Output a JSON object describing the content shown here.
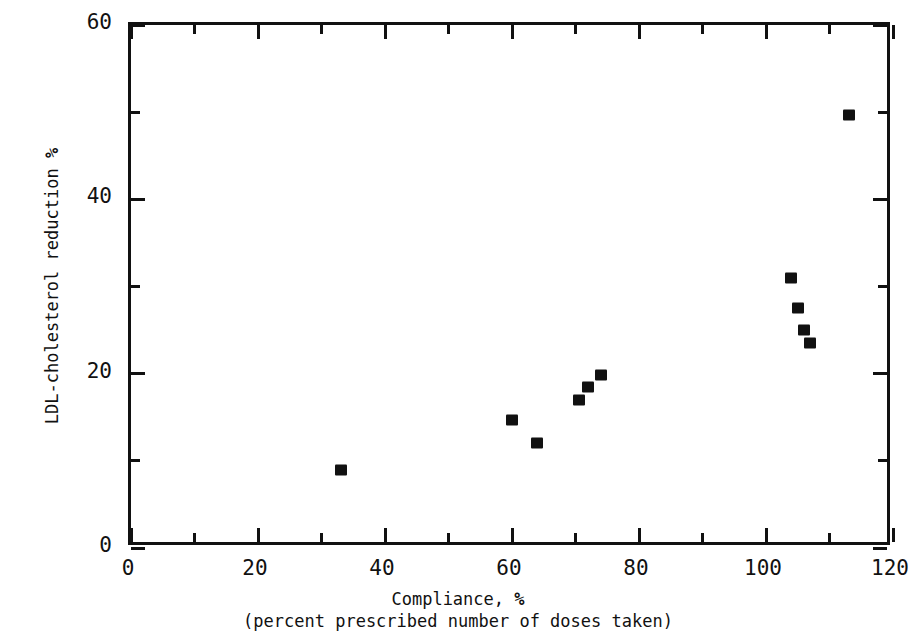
{
  "chart_data": {
    "type": "scatter",
    "title": "",
    "xlabel": "Compliance, %",
    "xlabel_sub": "(percent prescribed number of doses taken)",
    "ylabel": "LDL-cholesterol reduction %",
    "xlim": [
      0,
      120
    ],
    "ylim": [
      0,
      60
    ],
    "xticks": [
      0,
      20,
      40,
      60,
      80,
      100,
      120
    ],
    "yticks": [
      0,
      20,
      40,
      60
    ],
    "xticks_minor": [
      10,
      30,
      50,
      70,
      90,
      110
    ],
    "yticks_minor": [
      10,
      30,
      50
    ],
    "grid": false,
    "legend": null,
    "marker": "filled-square",
    "marker_color": "#111111",
    "points": [
      {
        "x": 33,
        "y": 9.0
      },
      {
        "x": 60,
        "y": 14.7
      },
      {
        "x": 64,
        "y": 12.0
      },
      {
        "x": 70.5,
        "y": 17.0
      },
      {
        "x": 72,
        "y": 18.5
      },
      {
        "x": 74,
        "y": 19.8
      },
      {
        "x": 104,
        "y": 31.0
      },
      {
        "x": 105,
        "y": 27.5
      },
      {
        "x": 106,
        "y": 25.0
      },
      {
        "x": 107,
        "y": 23.5
      },
      {
        "x": 113,
        "y": 49.7
      }
    ]
  },
  "axes": {
    "x_tick_labels": [
      "0",
      "20",
      "40",
      "60",
      "80",
      "100",
      "120"
    ],
    "y_tick_labels": [
      "0",
      "20",
      "40",
      "60"
    ],
    "x_title_main": "Compliance, %",
    "x_title_sub": "(percent prescribed number of doses taken)",
    "y_title": "LDL-cholesterol reduction %"
  },
  "style": {
    "background": "#ffffff",
    "ink": "#111111"
  }
}
